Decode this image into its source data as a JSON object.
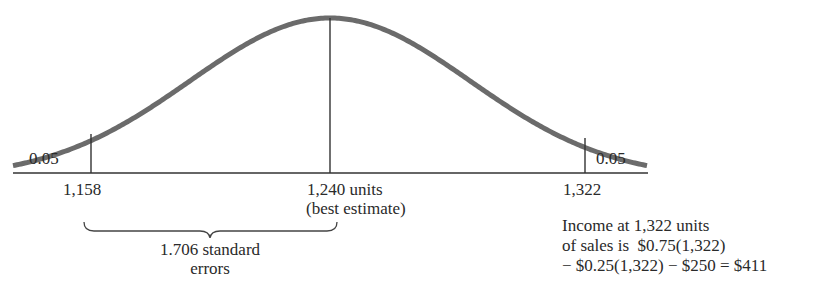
{
  "figure": {
    "type": "normal-distribution-diagram",
    "tail_left_label": "0.05",
    "tail_right_label": "0.05",
    "axis": {
      "left_mark": "1,158",
      "center_mark_line1": "1,240 units",
      "center_mark_line2": "(best estimate)",
      "right_mark": "1,322"
    },
    "brace_label_line1": "1.706 standard",
    "brace_label_line2": "errors",
    "annotation": {
      "line1": "Income at 1,322 units",
      "line2": "of sales is  $0.75(1,322)",
      "line3": "− $0.25(1,322) − $250 = $411"
    },
    "colors": {
      "curve": "#6b6b6b",
      "lines": "#333333",
      "text": "#2a2a2a"
    }
  },
  "chart_data": {
    "type": "line",
    "title": "",
    "mean": 1240,
    "lower_bound": 1158,
    "upper_bound": 1322,
    "tail_probability_left": 0.05,
    "tail_probability_right": 0.05,
    "standard_errors_from_mean": 1.706,
    "x_ticks": [
      "1,158",
      "1,240",
      "1,322"
    ],
    "xlabel": "units",
    "grid": false
  }
}
